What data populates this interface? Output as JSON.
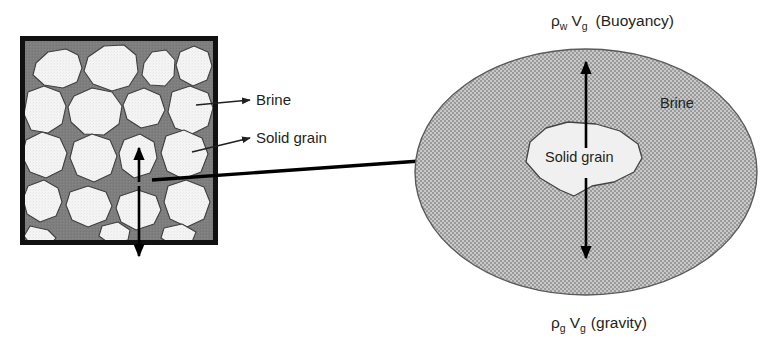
{
  "figure": {
    "background_color": "#ffffff"
  },
  "colors": {
    "brine_fill": "#7e7e7e",
    "grain_fill": "#f2f2f2",
    "grain_outline": "#3a3a3a",
    "square_border": "#111111",
    "ellipse_fill": "#b3b3b3",
    "ellipse_outline": "#4a4a4a",
    "arrow": "#000000",
    "text": "#231f20"
  },
  "left_panel": {
    "name": "porous-medium-square",
    "labels": [
      {
        "id": "brine",
        "text": "Brine"
      },
      {
        "id": "solid-grain",
        "text": "Solid grain"
      }
    ],
    "force_arrow": {
      "up_label": "buoyancy-direction",
      "down_label": "gravity-direction"
    }
  },
  "right_panel": {
    "name": "magnified-grain-ellipse",
    "medium_label": "Brine",
    "grain_label": "Solid grain",
    "equations": {
      "top": {
        "rho": "ρ",
        "rho_sub": "w",
        "v": "V",
        "v_sub": "g",
        "paren": "(Buoyancy)"
      },
      "bottom": {
        "rho": "ρ",
        "rho_sub": "g",
        "v": "V",
        "v_sub": "g",
        "paren": "(gravity)"
      }
    },
    "arrows": [
      {
        "id": "buoyancy-arrow",
        "direction": "up"
      },
      {
        "id": "gravity-arrow",
        "direction": "down"
      }
    ]
  },
  "connector": {
    "name": "magnification-connector",
    "description": "arrow from grain in square to ellipse"
  }
}
